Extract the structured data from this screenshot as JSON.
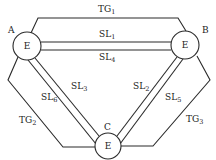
{
  "diagram": {
    "nodes": [
      {
        "id": "A",
        "label": "A",
        "inner": "E"
      },
      {
        "id": "B",
        "label": "B",
        "inner": "E"
      },
      {
        "id": "C",
        "label": "C",
        "inner": "E"
      }
    ],
    "links": [
      {
        "id": "TG1",
        "base": "TG",
        "sub": "1",
        "from": "A",
        "to": "B"
      },
      {
        "id": "SL1",
        "base": "SL",
        "sub": "1",
        "from": "A",
        "to": "B"
      },
      {
        "id": "SL4",
        "base": "SL",
        "sub": "4",
        "from": "A",
        "to": "B"
      },
      {
        "id": "SL3",
        "base": "SL",
        "sub": "3",
        "from": "A",
        "to": "C"
      },
      {
        "id": "SL6",
        "base": "SL",
        "sub": "6",
        "from": "A",
        "to": "C"
      },
      {
        "id": "TG2",
        "base": "TG",
        "sub": "2",
        "from": "A",
        "to": "C"
      },
      {
        "id": "SL2",
        "base": "SL",
        "sub": "2",
        "from": "B",
        "to": "C"
      },
      {
        "id": "SL5",
        "base": "SL",
        "sub": "5",
        "from": "B",
        "to": "C"
      },
      {
        "id": "TG3",
        "base": "TG",
        "sub": "3",
        "from": "B",
        "to": "C"
      }
    ]
  }
}
